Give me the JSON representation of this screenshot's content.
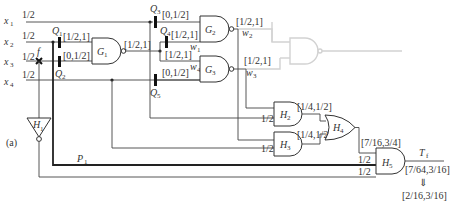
{
  "figure_label": "(a)",
  "inputs": [
    {
      "name": "x",
      "sub": "1",
      "value": "1/2"
    },
    {
      "name": "x",
      "sub": "2",
      "value": "1/2"
    },
    {
      "name": "x",
      "sub": "3",
      "value": "1/2"
    },
    {
      "name": "x",
      "sub": "4",
      "value": "1/2"
    }
  ],
  "fault": {
    "name": "f"
  },
  "switches": [
    {
      "name": "Q",
      "sub": "1"
    },
    {
      "name": "Q",
      "sub": "2"
    },
    {
      "name": "Q",
      "sub": "3"
    },
    {
      "name": "Q",
      "sub": "4"
    },
    {
      "name": "Q",
      "sub": "5"
    }
  ],
  "gates": {
    "G1": {
      "name": "G",
      "sub": "1",
      "in_a": "[1/2,1]",
      "in_b": "[0,1/2]",
      "out": "[1/2,1]"
    },
    "G2": {
      "name": "G",
      "sub": "2",
      "in_a": "[0,1/2]",
      "in_b": "[1/2,1]",
      "out": "[1/2,1]"
    },
    "G3": {
      "name": "G",
      "sub": "3",
      "in_a": "[1/2,1]",
      "in_b": "[0,1/2]",
      "out": "[1/2,1]"
    },
    "H1": {
      "name": "H",
      "sub": "1"
    },
    "H2": {
      "name": "H",
      "sub": "2",
      "in_b": "1/2",
      "out": "[1/4,1/2]"
    },
    "H3": {
      "name": "H",
      "sub": "3",
      "in_b": "1/2",
      "out": "[1/4,1/2]"
    },
    "H4": {
      "name": "H",
      "sub": "4",
      "out": "[7/16,3/4]"
    },
    "H5": {
      "name": "H",
      "sub": "5",
      "in_b": "1/2",
      "in_c": "1/2",
      "out": "[7/64,3/16]"
    }
  },
  "wires": {
    "w1": {
      "name": "w",
      "sub": "1"
    },
    "w2": {
      "name": "w",
      "sub": "2"
    },
    "w3": {
      "name": "w",
      "sub": "3"
    },
    "w4": {
      "name": "w",
      "sub": "4"
    },
    "P1": {
      "name": "P",
      "sub": "1"
    }
  },
  "output": {
    "name": "T",
    "sub": "f",
    "arrow": "⇓",
    "final": "[2/16,3/16]"
  }
}
